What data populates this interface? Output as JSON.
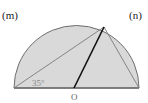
{
  "diagram": {
    "labels": {
      "m": "(m)",
      "n": "(n)",
      "angle": "35°",
      "center": "O"
    },
    "colors": {
      "fill": "#d9d9d9",
      "outline": "#6e6e6e",
      "thin_line": "#7a7a7a",
      "bold_line": "#111111",
      "text": "#222222",
      "angle_text": "#888888"
    }
  }
}
